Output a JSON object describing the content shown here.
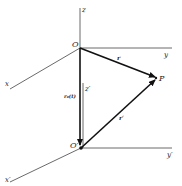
{
  "diagram": {
    "colors": {
      "line": "#333333",
      "vector": "#111111",
      "background": "#ffffff"
    },
    "frame_upper": {
      "origin_label": "O",
      "axis_z_label": "z",
      "axis_y_label": "y",
      "axis_x_label": "x"
    },
    "frame_lower": {
      "origin_label": "O′",
      "axis_z_label": "z′",
      "axis_y_label": "y′",
      "axis_x_label": "x′"
    },
    "point": {
      "label": "P"
    },
    "vectors": {
      "r": "r",
      "r_prime": "r′",
      "r0": "r₀(t)"
    }
  }
}
